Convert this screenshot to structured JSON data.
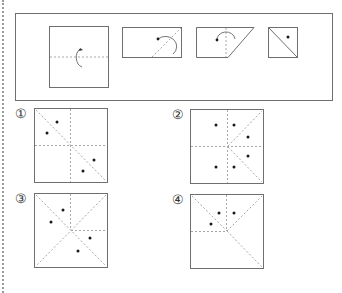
{
  "question": {
    "fold_steps": [
      {
        "id": "step-1",
        "shape": "square",
        "fold": "fold bottom half up along horizontal dashed line",
        "arrow": "curved-arrow",
        "dot": false
      },
      {
        "id": "step-2",
        "shape": "rectangle",
        "fold": "fold along diagonal dashed line",
        "arrow": "curved-arrow",
        "dot": true
      },
      {
        "id": "step-3",
        "shape": "trapezoid",
        "fold": "fold along vertical dashed line",
        "arrow": "curved-arrow",
        "dot": true
      },
      {
        "id": "step-4",
        "shape": "small-square-with-diagonal",
        "dot": true,
        "note": "hole punched"
      }
    ]
  },
  "options": [
    {
      "label": "①",
      "dots": 4
    },
    {
      "label": "②",
      "dots": 6
    },
    {
      "label": "③",
      "dots": 4
    },
    {
      "label": "④",
      "dots": 3
    }
  ],
  "colors": {
    "outline": "#6f6f6f",
    "dashed": "#a8a8a8",
    "dot": "#1a1a1a"
  }
}
